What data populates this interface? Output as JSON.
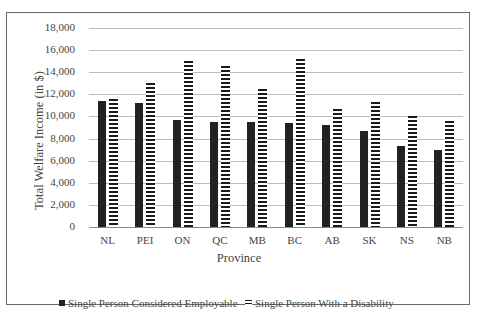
{
  "chart_data": {
    "type": "bar",
    "title": "",
    "xlabel": "Province",
    "ylabel": "Total Welfare Income (in $)",
    "ylim": [
      0,
      18000
    ],
    "yticks": [
      "0",
      "2,000",
      "4,000",
      "6,000",
      "8,000",
      "10,000",
      "12,000",
      "14,000",
      "16,000",
      "18,000"
    ],
    "grid": true,
    "legend_position": "bottom",
    "categories": [
      "NL",
      "PEI",
      "ON",
      "QC",
      "MB",
      "BC",
      "AB",
      "SK",
      "NS",
      "NB"
    ],
    "series": [
      {
        "name": "Single Person Considered Employable",
        "style": "solid",
        "color": "#222222",
        "values": [
          11400,
          11200,
          9700,
          9500,
          9500,
          9400,
          9200,
          8700,
          7300,
          7000
        ]
      },
      {
        "name": "Single Person With a Disability",
        "style": "horizontal-stripes",
        "color": "#1a1a1a",
        "values": [
          11600,
          13000,
          15000,
          14600,
          12500,
          15200,
          10700,
          11300,
          10000,
          9600
        ]
      }
    ]
  },
  "legend": {
    "employable": "Single Person Considered Employable",
    "disability": "Single Person With a Disability"
  }
}
